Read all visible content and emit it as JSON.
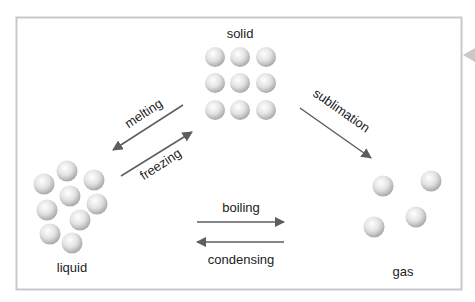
{
  "diagram": {
    "colors": {
      "frame": "#c9c9c9",
      "arrow": "#5e5e5e",
      "sphere_light": "#ffffff",
      "sphere_mid": "#e2e2e2",
      "sphere_dark": "#a9a9a9",
      "text": "#222222"
    },
    "states": {
      "solid": {
        "label": "solid",
        "particle_count": 9
      },
      "liquid": {
        "label": "liquid",
        "particle_count": 9
      },
      "gas": {
        "label": "gas",
        "particle_count": 4
      }
    },
    "transitions": {
      "melting": {
        "label": "melting",
        "from": "solid",
        "to": "liquid"
      },
      "freezing": {
        "label": "freezing",
        "from": "liquid",
        "to": "solid"
      },
      "sublimation": {
        "label": "sublimation",
        "from": "solid",
        "to": "gas"
      },
      "boiling": {
        "label": "boiling",
        "from": "liquid",
        "to": "gas"
      },
      "condensing": {
        "label": "condensing",
        "from": "gas",
        "to": "liquid"
      }
    }
  }
}
